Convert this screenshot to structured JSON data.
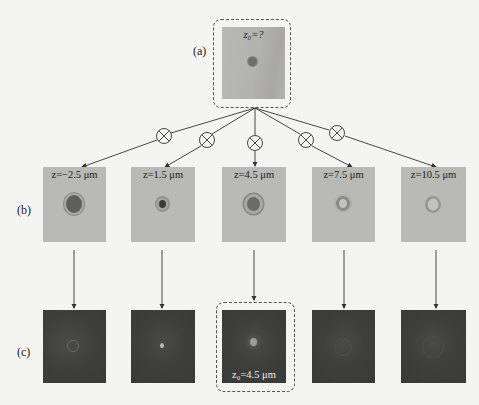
{
  "panel_labels": {
    "a": "(a)",
    "b": "(b)",
    "c": "(c)"
  },
  "top": {
    "caption": "z₀=?"
  },
  "row_b": [
    {
      "caption": "z=−2.5 μm"
    },
    {
      "caption": "z=1.5 μm"
    },
    {
      "caption": "z=4.5 μm"
    },
    {
      "caption": "z=7.5 μm"
    },
    {
      "caption": "z=10.5 μm"
    }
  ],
  "row_c": {
    "highlight_caption": "z₀=4.5 μm",
    "highlight_index": 2
  },
  "operator_symbol": "convolution-circle-times",
  "colors": {
    "line": "#333333",
    "hologram_bg": "#b9b9b6",
    "reconstruction_bg": "#3e3e3c",
    "dashed_frame": "#555555"
  }
}
